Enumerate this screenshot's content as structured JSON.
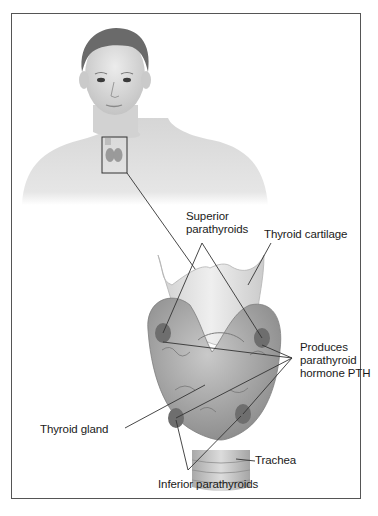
{
  "figure": {
    "labels": {
      "superior_parathyroids": [
        "Superior",
        "parathyroids"
      ],
      "thyroid_cartilage": "Thyroid cartilage",
      "produces_pth": [
        "Produces",
        "parathyroid",
        "hormone PTH"
      ],
      "thyroid_gland": "Thyroid gland",
      "trachea": "Trachea",
      "inferior_parathyroids": "Inferior parathyroids"
    },
    "colors": {
      "frame": "#555555",
      "leader_line": "#333333",
      "skin": "#d8d8d8",
      "hair": "#6a6a6a",
      "cartilage": "#e2e2e2",
      "gland": "#a8a8a8",
      "parathyroid": "#6e6e6e"
    }
  }
}
